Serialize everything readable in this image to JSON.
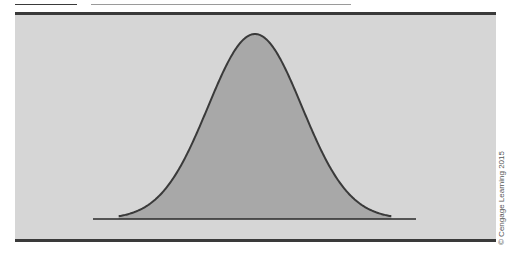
{
  "figure": {
    "title_visible": false,
    "watermark": "© Cengage Learning 2015"
  },
  "colors": {
    "panel_background": "#d6d6d6",
    "curve_fill": "#a8a8a8",
    "curve_stroke": "#3a3a3a",
    "frame_border": "#3a3a3a"
  },
  "chart_data": {
    "type": "area",
    "title": "",
    "subtitle": "",
    "xlabel": "",
    "ylabel": "",
    "distribution": "normal",
    "mean": 0,
    "std": 1,
    "x_range_shown": [
      -2.9,
      2.9
    ],
    "grid": false,
    "legend": null,
    "x": [
      -2.9,
      -2.5,
      -2.0,
      -1.5,
      -1.0,
      -0.5,
      0,
      0.5,
      1.0,
      1.5,
      2.0,
      2.5,
      2.9
    ],
    "values": [
      0.006,
      0.018,
      0.054,
      0.13,
      0.242,
      0.352,
      0.399,
      0.352,
      0.242,
      0.13,
      0.054,
      0.018,
      0.006
    ]
  }
}
